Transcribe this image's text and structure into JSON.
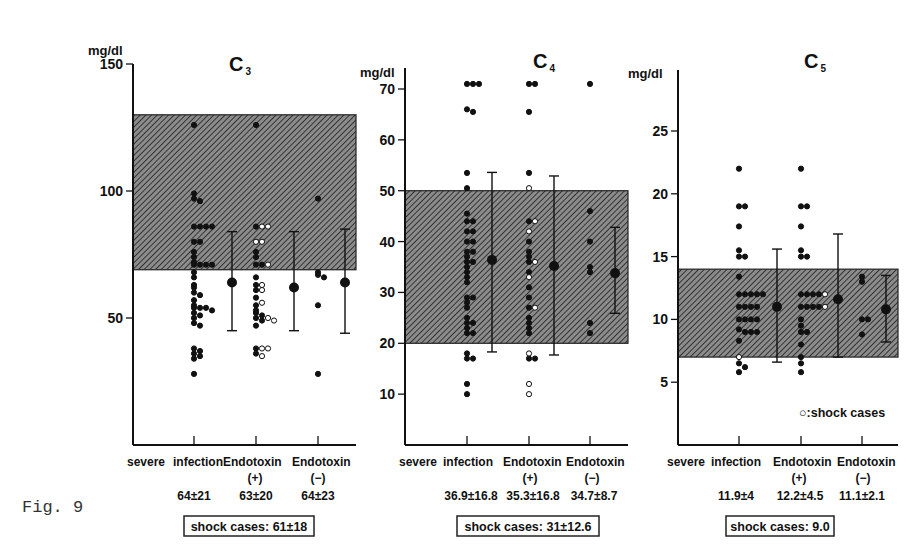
{
  "figure": {
    "label": "Fig. 9"
  },
  "legend": {
    "open_marker": "○",
    "text": ":shock cases"
  },
  "chart_data": [
    {
      "type": "scatter",
      "title": "C3",
      "title_main": "C",
      "title_sub": "3",
      "ylabel": "mg/dl",
      "ylim": [
        0,
        150
      ],
      "yticks": [
        50,
        100,
        150
      ],
      "normal_range": [
        69,
        130
      ],
      "categories": [
        "severe infection",
        "Endotoxin (+)",
        "Endotoxin (−)"
      ],
      "category_lines": [
        [
          "severe",
          "infection"
        ],
        [
          "Endotoxin",
          "(+)"
        ],
        [
          "Endotoxin",
          "(−)"
        ]
      ],
      "stats": [
        "64±21",
        "63±20",
        "64±23"
      ],
      "means": [
        64,
        63,
        64
      ],
      "sd": [
        21,
        20,
        23
      ],
      "error_bars": [
        {
          "mean": 64,
          "low": 45,
          "high": 84
        },
        {
          "mean": 62,
          "low": 45,
          "high": 84
        },
        {
          "mean": 64,
          "low": 44,
          "high": 85
        }
      ],
      "shock_cases": "shock cases: 61±18",
      "points": {
        "severe infection": {
          "filled": [
            126,
            99,
            97,
            96,
            86,
            86,
            86,
            86,
            80,
            80,
            76,
            74,
            72,
            71,
            71,
            71,
            71,
            68,
            66,
            63,
            62,
            60,
            59,
            57,
            55,
            54,
            54,
            54,
            53,
            52,
            51,
            50,
            48,
            47,
            38,
            37,
            36,
            35,
            34,
            28
          ],
          "open": []
        },
        "Endotoxin (+)": {
          "filled": [
            126,
            86,
            76,
            74,
            71,
            71,
            66,
            63,
            61,
            58,
            55,
            53,
            52,
            51,
            50,
            49,
            47,
            38,
            36
          ],
          "open": [
            86,
            86,
            80,
            80,
            71,
            63,
            61,
            56,
            50,
            49,
            38,
            38,
            35
          ]
        },
        "Endotoxin (−)": {
          "filled": [
            97,
            68,
            67,
            66,
            55,
            28
          ],
          "open": []
        }
      }
    },
    {
      "type": "scatter",
      "title": "C4",
      "title_main": "C",
      "title_sub": "4",
      "ylabel": "mg/dl",
      "ylim": [
        0,
        73
      ],
      "yticks": [
        10,
        20,
        30,
        40,
        50,
        60,
        70
      ],
      "normal_range": [
        20,
        50
      ],
      "categories": [
        "severe infection",
        "Endotoxin (+)",
        "Endotoxin (−)"
      ],
      "category_lines": [
        [
          "severe",
          "infection"
        ],
        [
          "Endotoxin",
          "(+)"
        ],
        [
          "Endotoxin",
          "(−)"
        ]
      ],
      "stats": [
        "36.9±16.8",
        "35.3±16.8",
        "34.7±8.7"
      ],
      "means": [
        36.9,
        35.3,
        34.7
      ],
      "sd": [
        16.8,
        16.8,
        8.7
      ],
      "error_bars": [
        {
          "mean": 36.4,
          "low": 18.3,
          "high": 53.6
        },
        {
          "mean": 35.2,
          "low": 17.7,
          "high": 52.9
        },
        {
          "mean": 33.8,
          "low": 25.9,
          "high": 42.8
        }
      ],
      "shock_cases": "shock cases: 31±12.6",
      "points": {
        "severe infection": {
          "filled": [
            71,
            71,
            71,
            66,
            65.5,
            53.5,
            50.5,
            45.5,
            44,
            44,
            42,
            42,
            40,
            40,
            38,
            38,
            37,
            36,
            36,
            35,
            34,
            33,
            32,
            29,
            29,
            28,
            27,
            25,
            24,
            24,
            23,
            22,
            22,
            18,
            17,
            17,
            12,
            10
          ],
          "open": []
        },
        "Endotoxin (+)": {
          "filled": [
            71,
            71,
            65.5,
            53.5,
            44,
            40,
            38,
            37,
            36,
            34,
            31,
            29,
            27,
            25,
            24,
            23,
            22,
            17,
            17
          ],
          "open": [
            50.5,
            44,
            42,
            36,
            33,
            27,
            18,
            12,
            10
          ]
        },
        "Endotoxin (−)": {
          "filled": [
            71,
            46,
            40,
            35,
            34,
            24,
            22
          ],
          "open": []
        }
      }
    },
    {
      "type": "scatter",
      "title": "C5",
      "title_main": "C",
      "title_sub": "5",
      "ylabel": "mg/dl",
      "ylim": [
        0,
        29
      ],
      "yticks": [
        5,
        10,
        15,
        20,
        25
      ],
      "normal_range": [
        7,
        14
      ],
      "categories": [
        "severe infection",
        "Endotoxin (+)",
        "Endotoxin (−)"
      ],
      "category_lines": [
        [
          "severe",
          "infection"
        ],
        [
          "Endotoxin",
          "(+)"
        ],
        [
          "Endotoxin",
          "(−)"
        ]
      ],
      "stats": [
        "11.9±4",
        "12.2±4.5",
        "11.1±2.1"
      ],
      "means": [
        11.9,
        12.2,
        11.1
      ],
      "sd": [
        4,
        4.5,
        2.1
      ],
      "error_bars": [
        {
          "mean": 11,
          "low": 6.6,
          "high": 15.6
        },
        {
          "mean": 11.6,
          "low": 7,
          "high": 16.8
        },
        {
          "mean": 10.8,
          "low": 8.2,
          "high": 13.5
        }
      ],
      "shock_cases": "shock cases: 9.0",
      "points": {
        "severe infection": {
          "filled": [
            22,
            19,
            19,
            17.4,
            15.5,
            15,
            15,
            13.4,
            12,
            12,
            12,
            12,
            12,
            11,
            11,
            11,
            11,
            10,
            10,
            10,
            10,
            9.2,
            9,
            9,
            9,
            8.3,
            6.5,
            6.2,
            5.8
          ],
          "open": [
            7
          ]
        },
        "Endotoxin (+)": {
          "filled": [
            22,
            19,
            19,
            17.4,
            15.5,
            15,
            15,
            12,
            12,
            12,
            12,
            11,
            11,
            11,
            11,
            10,
            9.5,
            9,
            9,
            8,
            7,
            6.5,
            5.8
          ],
          "open": [
            12,
            11
          ]
        },
        "Endotoxin (−)": {
          "filled": [
            13.4,
            13,
            10,
            10,
            8.8
          ],
          "open": []
        }
      }
    }
  ],
  "panels": [
    {
      "title_main": "C",
      "title_sub": "3",
      "ylabel": "mg/dl",
      "cat1a": "severe",
      "cat1b": "infection",
      "cat2a": "Endotoxin",
      "cat2b": "(+)",
      "cat3a": "Endotoxin",
      "cat3b": "(−)",
      "stat1": "64±21",
      "stat2": "63±20",
      "stat3": "64±23",
      "shock": "shock cases: 61±18"
    },
    {
      "title_main": "C",
      "title_sub": "4",
      "ylabel": "mg/dl",
      "cat1a": "severe",
      "cat1b": "infection",
      "cat2a": "Endotoxin",
      "cat2b": "(+)",
      "cat3a": "Endotoxin",
      "cat3b": "(−)",
      "stat1": "36.9±16.8",
      "stat2": "35.3±16.8",
      "stat3": "34.7±8.7",
      "shock": "shock cases: 31±12.6"
    },
    {
      "title_main": "C",
      "title_sub": "5",
      "ylabel": "mg/dl",
      "cat1a": "severe",
      "cat1b": "infection",
      "cat2a": "Endotoxin",
      "cat2b": "(+)",
      "cat3a": "Endotoxin",
      "cat3b": "(−)",
      "stat1": "11.9±4",
      "stat2": "12.2±4.5",
      "stat3": "11.1±2.1",
      "shock": "shock cases: 9.0"
    }
  ]
}
